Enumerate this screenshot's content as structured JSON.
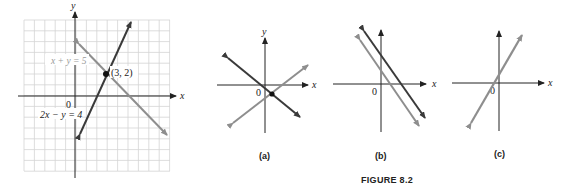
{
  "figure_caption": "FIGURE 8.2",
  "colors": {
    "dark_line": "#3a3a3a",
    "light_line": "#8e8e8e",
    "grid": "#d4d4d4",
    "axis": "#222222"
  },
  "main_graph": {
    "x_axis_label": "x",
    "y_axis_label": "y",
    "origin_label": "0",
    "equation_1": {
      "label": "x + y = 5",
      "style": "light",
      "slope": -1,
      "intercept": 5
    },
    "equation_2": {
      "label": "2x − y = 4",
      "style": "dark",
      "slope": 2,
      "intercept": -4
    },
    "intersection": {
      "label": "(3, 2)",
      "x": 3,
      "y": 2
    },
    "grid_range": {
      "x": [
        -6,
        9
      ],
      "y": [
        -7,
        7
      ]
    }
  },
  "panels": [
    {
      "caption": "(a)",
      "x_axis_label": "x",
      "y_axis_label": "y",
      "origin_label": "0",
      "description": "intersecting lines"
    },
    {
      "caption": "(b)",
      "x_axis_label": "x",
      "y_axis_label": "y",
      "origin_label": "0",
      "description": "parallel lines"
    },
    {
      "caption": "(c)",
      "x_axis_label": "x",
      "y_axis_label": "y",
      "origin_label": "0",
      "description": "coincident lines"
    }
  ]
}
